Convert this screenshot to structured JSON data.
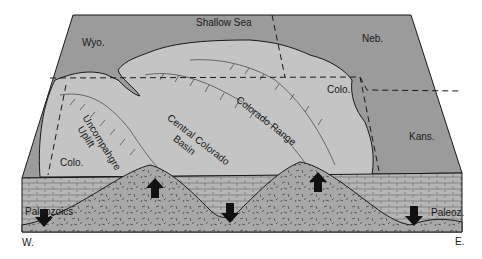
{
  "diagram": {
    "type": "geologic block diagram",
    "colors": {
      "sea": "#9b9b9b",
      "land": "#c4c4c4",
      "crust": "#a8a8a8",
      "sediment": "#b3b3b3",
      "line": "#1a1a1a",
      "background": "#ffffff"
    },
    "labels": {
      "shallow_sea": "Shallow Sea",
      "wyo": "Wyo.",
      "neb": "Neb.",
      "colo_east": "Colo.",
      "colo_west": "Colo.",
      "kans": "Kans.",
      "uncompahgre": "Uncompahgre",
      "uplift": "Uplift",
      "central_colorado": "Central Colorado",
      "basin": "Basin",
      "colorado_range": "Colorado Range",
      "paleozoics": "Paleozoics",
      "paleoz": "Paleoz.",
      "west": "W.",
      "east": "E."
    },
    "arrows": [
      {
        "name": "uplift-arrow-uncompahgre",
        "direction": "up"
      },
      {
        "name": "subsidence-arrow-basin",
        "direction": "down"
      },
      {
        "name": "uplift-arrow-colorado-range",
        "direction": "up"
      },
      {
        "name": "subsidence-arrow-west",
        "direction": "down"
      },
      {
        "name": "subsidence-arrow-east",
        "direction": "down"
      }
    ]
  }
}
